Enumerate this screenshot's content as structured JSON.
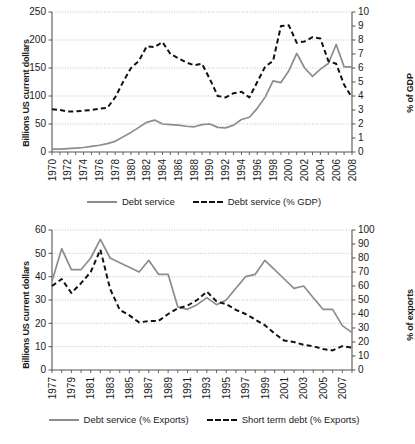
{
  "figure": {
    "background": "#ffffff",
    "solid_color": "#8c8c8c",
    "dashed_color": "#111111",
    "grid_color": "#aaaaaa",
    "axis_color": "#555555"
  },
  "chart_data": [
    {
      "type": "line",
      "title": "",
      "xlabel": "",
      "ylabel": "Billions US current dollars",
      "y2label": "% of GDP",
      "ylim": [
        0,
        250
      ],
      "y2lim": [
        0,
        10
      ],
      "yticks": [
        0,
        50,
        100,
        150,
        200,
        250
      ],
      "y2ticks": [
        0,
        1,
        2,
        3,
        4,
        5,
        6,
        7,
        8,
        9,
        10
      ],
      "xlim": [
        1970,
        2008
      ],
      "xticks": [
        1970,
        1972,
        1974,
        1976,
        1978,
        1980,
        1982,
        1984,
        1986,
        1988,
        1990,
        1992,
        1994,
        1996,
        1998,
        2000,
        2002,
        2004,
        2006,
        2008
      ],
      "xticklabels": [
        "1970",
        "1972",
        "1974",
        "1976",
        "1978",
        "1980",
        "1982",
        "1984",
        "1986",
        "1988",
        "1990",
        "1992",
        "1994",
        "1996",
        "1998",
        "2000",
        "2002",
        "2004",
        "2006",
        "2008"
      ],
      "grid": true,
      "legend_position": "bottom",
      "x": [
        1970,
        1971,
        1972,
        1973,
        1974,
        1975,
        1976,
        1977,
        1978,
        1979,
        1980,
        1981,
        1982,
        1983,
        1984,
        1985,
        1986,
        1987,
        1988,
        1989,
        1990,
        1991,
        1992,
        1993,
        1994,
        1995,
        1996,
        1997,
        1998,
        1999,
        2000,
        2001,
        2002,
        2003,
        2004,
        2005,
        2006,
        2007,
        2008
      ],
      "series": [
        {
          "name": "Debt service",
          "style": "solid",
          "axis": "left",
          "unit": "Billions US current dollars",
          "values": [
            5,
            5,
            6,
            7,
            8,
            10,
            12,
            15,
            19,
            27,
            35,
            44,
            53,
            57,
            50,
            49,
            48,
            46,
            45,
            49,
            50,
            44,
            43,
            48,
            58,
            62,
            78,
            98,
            127,
            124,
            145,
            176,
            150,
            135,
            148,
            158,
            192,
            152,
            152
          ]
        },
        {
          "name": "Debt service (% GDP)",
          "style": "dashed",
          "axis": "right",
          "unit": "% of GDP",
          "values": [
            3.05,
            3.0,
            2.9,
            2.9,
            2.95,
            3.0,
            3.1,
            3.15,
            3.9,
            5.0,
            6.0,
            6.5,
            7.55,
            7.5,
            7.85,
            7.0,
            6.7,
            6.4,
            6.2,
            6.3,
            5.2,
            4.0,
            3.9,
            4.2,
            4.3,
            3.9,
            5.0,
            6.1,
            6.5,
            9.0,
            9.05,
            7.8,
            7.9,
            8.2,
            8.1,
            6.5,
            6.3,
            4.8,
            3.9
          ]
        }
      ],
      "legend": [
        {
          "label": "Debt service",
          "style": "solid"
        },
        {
          "label": "Debt service (% GDP)",
          "style": "dashed"
        }
      ]
    },
    {
      "type": "line",
      "title": "",
      "xlabel": "",
      "ylabel": "Billions US current dollars",
      "y2label": "% of exports",
      "ylim": [
        0,
        60
      ],
      "y2lim": [
        0,
        100
      ],
      "yticks": [
        0,
        10,
        20,
        30,
        40,
        50,
        60
      ],
      "y2ticks": [
        0,
        10,
        20,
        30,
        40,
        50,
        60,
        70,
        80,
        90,
        100
      ],
      "xlim": [
        1977,
        2008
      ],
      "xticks": [
        1977,
        1979,
        1981,
        1983,
        1985,
        1987,
        1989,
        1991,
        1993,
        1995,
        1997,
        1999,
        2001,
        2003,
        2005,
        2007
      ],
      "xticklabels": [
        "1977",
        "1979",
        "1981",
        "1983",
        "1985",
        "1987",
        "1989",
        "1991",
        "1993",
        "1995",
        "1997",
        "1999",
        "2001",
        "2003",
        "2005",
        "2007"
      ],
      "grid": true,
      "legend_position": "bottom",
      "x": [
        1977,
        1978,
        1979,
        1980,
        1981,
        1982,
        1983,
        1984,
        1985,
        1986,
        1987,
        1988,
        1989,
        1990,
        1991,
        1992,
        1993,
        1994,
        1995,
        1996,
        1997,
        1998,
        1999,
        2000,
        2001,
        2002,
        2003,
        2004,
        2005,
        2006,
        2007,
        2008
      ],
      "series": [
        {
          "name": "Debt service  (% Exports)",
          "style": "solid",
          "axis": "left",
          "unit": "Billions US current dollars",
          "values": [
            38,
            52,
            43,
            43,
            48,
            56,
            48,
            46,
            44,
            42,
            47,
            41,
            41,
            27,
            26,
            28,
            31,
            28,
            30,
            35,
            40,
            41,
            47,
            43,
            39,
            35,
            36,
            31,
            26,
            26,
            19,
            16
          ]
        },
        {
          "name": "Short term debt  (% Exports)",
          "style": "dashed",
          "axis": "right",
          "unit": "% of exports",
          "values": [
            60,
            65,
            55,
            62,
            70,
            86,
            58,
            43,
            39,
            34,
            35,
            35,
            40,
            44,
            46,
            50,
            56,
            49,
            47,
            43,
            40,
            36,
            32,
            26,
            21,
            20,
            18,
            17,
            15,
            14,
            17,
            16
          ]
        }
      ],
      "legend": [
        {
          "label": "Debt service  (% Exports)",
          "style": "solid"
        },
        {
          "label": "Short term debt  (% Exports)",
          "style": "dashed"
        }
      ]
    }
  ]
}
